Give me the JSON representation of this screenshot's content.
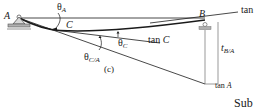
{
  "figure": {
    "caption": "(c)",
    "points": {
      "A": "A",
      "B": "B",
      "C": "C"
    },
    "angles": {
      "theta_A": {
        "symbol": "θ",
        "sub": "A"
      },
      "theta_C": {
        "symbol": "θ",
        "sub": "C"
      },
      "theta_C_A": {
        "symbol": "θ",
        "sub": "C/A"
      }
    },
    "tangents": {
      "tan_B_label": "tan",
      "tan_C_label_prefix": "tan ",
      "tan_C_label_var": "C",
      "tan_A_label_prefix": "tan ",
      "tan_A_label_var": "A"
    },
    "deviation": {
      "symbol": "t",
      "sub": "B/A"
    },
    "cut_off_text": "Sub",
    "colors": {
      "line": "#1a1a1a",
      "support": "#555555",
      "support_fill": "#b0b0b0"
    }
  }
}
